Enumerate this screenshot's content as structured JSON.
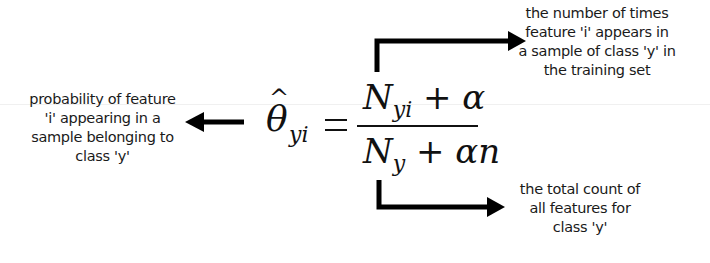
{
  "formula": {
    "lhs_symbol": "θ",
    "lhs_hat": "^",
    "lhs_subscript": "yi",
    "equals": "=",
    "numerator": {
      "symbol": "N",
      "subscript": "yi",
      "rest": "+ α"
    },
    "denominator": {
      "symbol": "N",
      "subscript": "y",
      "rest": "+ αn"
    }
  },
  "annotations": {
    "left": {
      "lines": [
        "probability of feature",
        "'i' appearing in a",
        "sample belonging to",
        "class 'y'"
      ]
    },
    "top_right": {
      "lines": [
        "the number of times",
        "feature 'i' appears in",
        "a sample of class 'y' in",
        "the training set"
      ]
    },
    "bottom_right": {
      "lines": [
        "the total count of",
        "all features for",
        "class 'y'"
      ]
    }
  },
  "colors": {
    "arrow": "#000000",
    "text": "#1a1a1a",
    "background": "#ffffff"
  }
}
